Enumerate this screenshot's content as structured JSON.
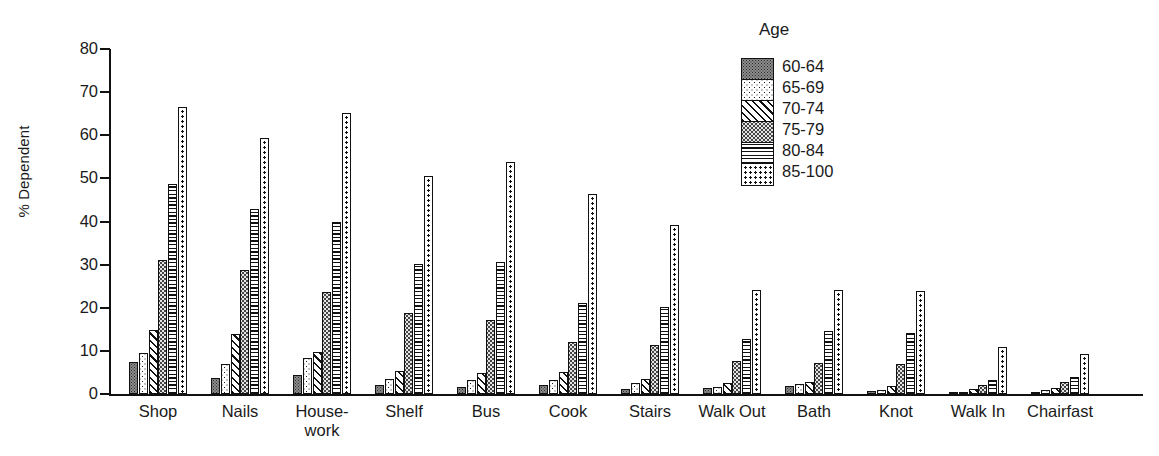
{
  "chart_data": {
    "type": "bar",
    "title": "",
    "xlabel": "",
    "ylabel": "% Dependent",
    "ylim": [
      0,
      80
    ],
    "yticks": [
      0,
      10,
      20,
      30,
      40,
      50,
      60,
      70,
      80
    ],
    "grid": false,
    "legend_title": "Age",
    "legend_position": "top-right",
    "categories": [
      "Shop",
      "Nails",
      "House-\nwork",
      "Shelf",
      "Bus",
      "Cook",
      "Stairs",
      "Walk Out",
      "Bath",
      "Knot",
      "Walk In",
      "Chairfast"
    ],
    "series": [
      {
        "name": "60-64",
        "values": [
          7.4,
          3.7,
          4.5,
          2.2,
          1.7,
          2.2,
          1.2,
          1.4,
          1.9,
          0.6,
          0.4,
          0.4
        ]
      },
      {
        "name": "65-69",
        "values": [
          9.4,
          7.0,
          8.3,
          3.5,
          3.3,
          3.2,
          2.5,
          1.6,
          2.4,
          1.0,
          0.5,
          0.9
        ]
      },
      {
        "name": "70-74",
        "values": [
          14.8,
          13.9,
          9.7,
          5.4,
          4.9,
          5.0,
          3.4,
          2.6,
          2.9,
          1.8,
          1.1,
          1.3
        ]
      },
      {
        "name": "75-79",
        "values": [
          31.0,
          28.7,
          23.7,
          18.8,
          17.2,
          12.0,
          11.3,
          7.6,
          7.1,
          7.0,
          2.2,
          2.8
        ]
      },
      {
        "name": "80-84",
        "values": [
          48.7,
          42.8,
          40.0,
          30.1,
          30.7,
          21.0,
          20.2,
          12.8,
          14.7,
          14.2,
          3.2,
          4.0
        ]
      },
      {
        "name": "85-100",
        "values": [
          66.5,
          59.3,
          65.2,
          50.5,
          53.8,
          46.4,
          39.2,
          24.2,
          24.1,
          23.8,
          11.0,
          9.3
        ]
      }
    ],
    "series_patterns": [
      "dark-stipple",
      "sparse-dots",
      "diagonal-hatch",
      "medium-stipple",
      "horizontal-lines",
      "open-dots"
    ],
    "colors": {
      "axis": "#111111",
      "text": "#1a1a1a",
      "background": "#ffffff"
    }
  }
}
